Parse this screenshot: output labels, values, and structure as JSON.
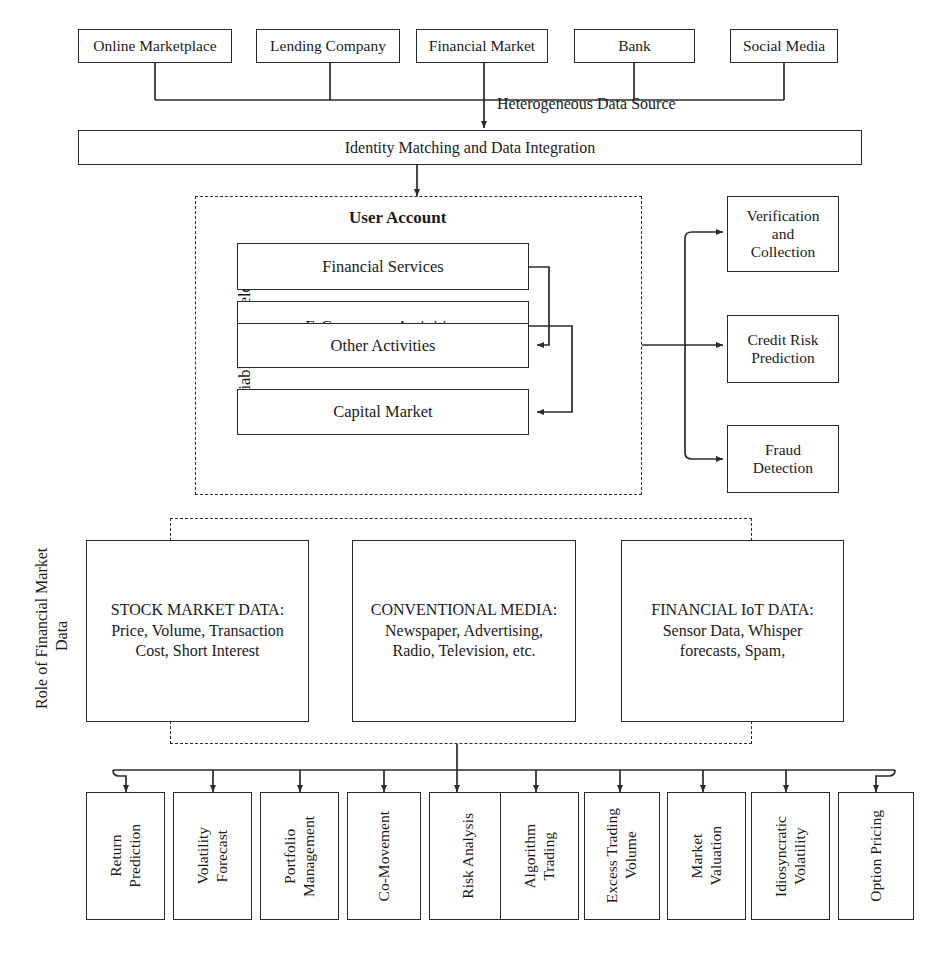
{
  "diagram": {
    "sources": {
      "flow_label": "Heterogeneous Data Source",
      "items": [
        {
          "label": "Online Marketplace"
        },
        {
          "label": "Lending Company"
        },
        {
          "label": "Financial Market"
        },
        {
          "label": "Bank"
        },
        {
          "label": "Social Media"
        }
      ]
    },
    "integration": {
      "label": "Identity Matching and Data Integration"
    },
    "user_account": {
      "title": "User Account",
      "side_label": "Variable Data Fields",
      "fields": [
        {
          "label": "Financial Services"
        },
        {
          "label": "E-Commerce Activities"
        },
        {
          "label": "Other Activities"
        },
        {
          "label": "Capital Market"
        }
      ]
    },
    "applications": [
      {
        "label": "Verification\nand\nCollection"
      },
      {
        "label": "Credit Risk\nPrediction"
      },
      {
        "label": "Fraud\nDetection"
      }
    ],
    "role_section": {
      "side_label": "Role of Financial Market\nData",
      "data_boxes": [
        {
          "heading": "STOCK MARKET DATA:",
          "body": "Price, Volume, Transaction\nCost, Short Interest"
        },
        {
          "heading": "CONVENTIONAL MEDIA:",
          "body": "Newspaper, Advertising,\nRadio, Television, etc."
        },
        {
          "heading": "FINANCIAL IoT DATA:",
          "body": "Sensor Data, Whisper\nforecasts, Spam,"
        }
      ]
    },
    "outcomes": [
      {
        "label": "Return\nPrediction"
      },
      {
        "label": "Volatility\nForecast"
      },
      {
        "label": "Portfolio\nManagement"
      },
      {
        "label": "Co-Movement"
      },
      {
        "label": "Risk Analysis"
      },
      {
        "label": "Algorithm\nTrading"
      },
      {
        "label": "Excess Trading\nVolume"
      },
      {
        "label": "Market\nValuation"
      },
      {
        "label": "Idiosyncratic\nVolatility"
      },
      {
        "label": "Option Pricing"
      }
    ],
    "colors": {
      "line": "#2b2b2b",
      "text": "#1a1a1a",
      "background": "#ffffff"
    }
  }
}
